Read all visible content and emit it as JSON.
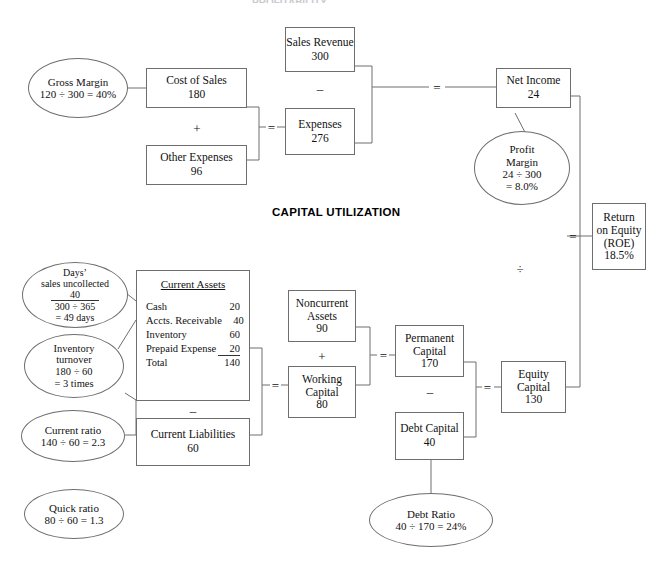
{
  "page_title": "PROFITABILITY",
  "sections": {
    "capital_utilization": "CAPITAL UTILIZATION"
  },
  "operators": {
    "plus_cost_other": "+",
    "equals_expenses": "=",
    "minus_revenue_expenses": "–",
    "equals_net_income": "=",
    "equals_roe": "=",
    "divide_roe": "÷",
    "minus_assets_liabilities": "–",
    "equals_working_capital": "=",
    "plus_noncurrent_working": "+",
    "equals_permanent_capital": "=",
    "minus_permanent_debt": "–",
    "equals_equity_capital": "="
  },
  "boxes": {
    "cost_of_sales": {
      "label": "Cost of Sales",
      "value": "180"
    },
    "other_expenses": {
      "label": "Other Expenses",
      "value": "96"
    },
    "sales_revenue": {
      "label": "Sales Revenue",
      "value": "300"
    },
    "expenses": {
      "label": "Expenses",
      "value": "276"
    },
    "net_income": {
      "label": "Net Income",
      "value": "24"
    },
    "return_on_equity": {
      "line1": "Return",
      "line2": "on Equity",
      "line3": "(ROE)",
      "value": "18.5%"
    },
    "noncurrent_assets": {
      "line1": "Noncurrent",
      "line2": "Assets",
      "value": "90"
    },
    "working_capital": {
      "line1": "Working",
      "line2": "Capital",
      "value": "80"
    },
    "permanent_capital": {
      "line1": "Permanent",
      "line2": "Capital",
      "value": "170"
    },
    "debt_capital": {
      "label": "Debt Capital",
      "value": "40"
    },
    "equity_capital": {
      "line1": "Equity",
      "line2": "Capital",
      "value": "130"
    },
    "current_liabilities": {
      "label": "Current Liabilities",
      "value": "60"
    }
  },
  "current_assets": {
    "heading": "Current Assets",
    "rows": [
      {
        "label": "Cash",
        "value": "20"
      },
      {
        "label": "Accts. Receivable",
        "value": "40"
      },
      {
        "label": "Inventory",
        "value": "60"
      },
      {
        "label": "Prepaid Expense",
        "value": "20"
      },
      {
        "label": "Total",
        "value": "140"
      }
    ]
  },
  "ellipses": {
    "gross_margin": {
      "line1": "Gross Margin",
      "line2": "120 ÷ 300 = 40%"
    },
    "profit_margin": {
      "line1": "Profit",
      "line2": "Margin",
      "line3": "24 ÷ 300",
      "line4": "= 8.0%"
    },
    "days_sales_uncollected": {
      "line1": "Days’",
      "line2": "sales uncollected",
      "numerator": "40",
      "denominator": "300 ÷ 365",
      "line5": "= 49 days"
    },
    "inventory_turnover": {
      "line1": "Inventory",
      "line2": "turnover",
      "line3": "180 ÷ 60",
      "line4": "= 3 times"
    },
    "current_ratio": {
      "line1": "Current ratio",
      "line2": "140 ÷ 60 = 2.3"
    },
    "quick_ratio": {
      "line1": "Quick ratio",
      "line2": "80 ÷ 60 = 1.3"
    },
    "debt_ratio": {
      "line1": "Debt Ratio",
      "line2": "40 ÷ 170 = 24%"
    }
  },
  "colors": {
    "stroke": "#6e6e6e",
    "text": "#111111",
    "background": "#ffffff"
  }
}
